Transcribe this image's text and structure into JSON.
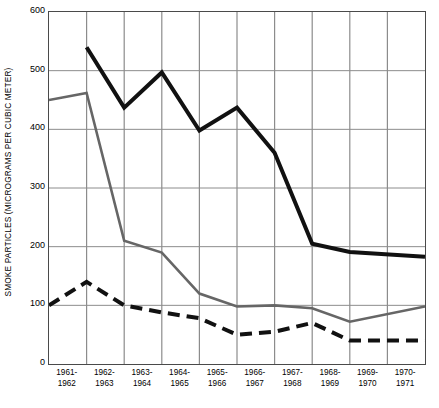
{
  "chart_data": {
    "type": "line",
    "title": "",
    "subtitle": "",
    "xlabel": "",
    "ylabel": "SMOKE PARTICLES (MICROGRAMS PER CUBIC METER)",
    "categories": [
      "1961-1962",
      "1962-1963",
      "1963-1964",
      "1964-1965",
      "1965-1966",
      "1966-1967",
      "1967-1968",
      "1968-1969",
      "1969-1970",
      "1970-1971"
    ],
    "x_tick_lines": [
      [
        "1961-",
        "1962"
      ],
      [
        "1962-",
        "1963"
      ],
      [
        "1963-",
        "1964"
      ],
      [
        "1964-",
        "1965"
      ],
      [
        "1965-",
        "1966"
      ],
      [
        "1966-",
        "1967"
      ],
      [
        "1967-",
        "1968"
      ],
      [
        "1968-",
        "1969"
      ],
      [
        "1969-",
        "1970"
      ],
      [
        "1970-",
        "1971"
      ]
    ],
    "ylim": [
      0,
      600
    ],
    "xlim": [
      0,
      10
    ],
    "y_ticks": [
      0,
      100,
      200,
      300,
      400,
      500,
      600
    ],
    "y_tick_labels": [
      "0",
      "100",
      "200",
      "300",
      "400",
      "500",
      "600"
    ],
    "grid": true,
    "grid_color": "#8c8c8c",
    "legend": "none",
    "series": [
      {
        "name": "black-solid",
        "style": "solid",
        "color": "#111111",
        "width": 4.0,
        "x": [
          1,
          2,
          3,
          4,
          5,
          6,
          7,
          8,
          9,
          10
        ],
        "values": [
          540,
          437,
          497,
          398,
          437,
          360,
          205,
          191,
          183,
          null
        ],
        "points": [
          {
            "x": 1,
            "y": 540
          },
          {
            "x": 2,
            "y": 437
          },
          {
            "x": 3,
            "y": 497
          },
          {
            "x": 4,
            "y": 398
          },
          {
            "x": 5,
            "y": 437
          },
          {
            "x": 6,
            "y": 360
          },
          {
            "x": 7,
            "y": 205
          },
          {
            "x": 8,
            "y": 191
          },
          {
            "x": 10,
            "y": 183
          }
        ]
      },
      {
        "name": "gray-solid",
        "style": "solid",
        "color": "#666666",
        "width": 2.6,
        "x": [
          0,
          1,
          2,
          3,
          4,
          5,
          6,
          7,
          8,
          9,
          10
        ],
        "values": [
          450,
          462,
          210,
          190,
          120,
          98,
          100,
          95,
          72,
          98,
          null
        ],
        "points": [
          {
            "x": 0,
            "y": 450
          },
          {
            "x": 1,
            "y": 462
          },
          {
            "x": 2,
            "y": 210
          },
          {
            "x": 3,
            "y": 190
          },
          {
            "x": 4,
            "y": 120
          },
          {
            "x": 5,
            "y": 98
          },
          {
            "x": 6,
            "y": 100
          },
          {
            "x": 7,
            "y": 95
          },
          {
            "x": 8,
            "y": 72
          },
          {
            "x": 10,
            "y": 98
          }
        ]
      },
      {
        "name": "black-dashed",
        "style": "dashed",
        "color": "#111111",
        "width": 4.0,
        "dash": "12 7",
        "x": [
          0,
          1,
          2,
          3,
          4,
          5,
          6,
          7,
          8,
          9,
          10
        ],
        "values": [
          100,
          140,
          100,
          88,
          78,
          50,
          55,
          70,
          40,
          40,
          null
        ],
        "points": [
          {
            "x": 0,
            "y": 100
          },
          {
            "x": 1,
            "y": 140
          },
          {
            "x": 2,
            "y": 100
          },
          {
            "x": 3,
            "y": 88
          },
          {
            "x": 4,
            "y": 78
          },
          {
            "x": 5,
            "y": 50
          },
          {
            "x": 6,
            "y": 55
          },
          {
            "x": 7,
            "y": 70
          },
          {
            "x": 8,
            "y": 40
          },
          {
            "x": 10,
            "y": 40
          }
        ]
      }
    ]
  }
}
